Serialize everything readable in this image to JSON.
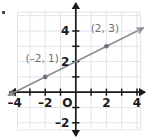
{
  "figure": {
    "title": "",
    "corner_mark": "bullet-mark"
  },
  "chart_data": {
    "type": "line",
    "title": "",
    "xlabel": "",
    "ylabel": "",
    "xlim": [
      -4.5,
      4.5
    ],
    "ylim": [
      -2.5,
      4.8
    ],
    "grid": true,
    "grid_color": "#e3e3e8",
    "axis_color": "#1a1a1a",
    "line_color": "#8c8c96",
    "point_color": "#6e6e78",
    "label_color": "#6e6e78",
    "tick_label_color": "#1a1a1a",
    "legend": "none",
    "xticks": [
      -4,
      -2,
      2,
      4
    ],
    "xtick_labels": [
      "–4",
      "–2",
      "2",
      "4"
    ],
    "yticks": [
      -2,
      2,
      4
    ],
    "ytick_labels": [
      "–2",
      "2",
      "4"
    ],
    "origin_label": "O",
    "series": [
      {
        "name": "line",
        "equation": "y = 0.5x + 2",
        "slope": 0.5,
        "intercept": 2,
        "x": [
          -4.4,
          4.4
        ],
        "y": [
          -0.2,
          4.2
        ],
        "arrow_start": true,
        "arrow_end": true
      }
    ],
    "points": [
      {
        "label": "(–2, 1)",
        "x": -2,
        "y": 1,
        "label_dx": -0.2,
        "label_dy": 1.0
      },
      {
        "label": "(2, 3)",
        "x": 2,
        "y": 3,
        "label_dx": -0.1,
        "label_dy": 0.95
      }
    ],
    "annotations": [
      {
        "text": "(–2, 1)",
        "x": -2,
        "y": 1
      },
      {
        "text": "(2, 3)",
        "x": 2,
        "y": 3
      }
    ]
  }
}
